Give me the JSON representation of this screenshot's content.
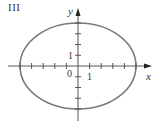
{
  "panel_label": "III",
  "chart_data": {
    "type": "line",
    "title": "III",
    "xlabel": "x",
    "ylabel": "y",
    "curve": "ellipse",
    "equation": "x^2/25 + y^2/16 = 1",
    "center": [
      0,
      0
    ],
    "semi_axis_x": 5,
    "semi_axis_y": 4,
    "xlim": [
      -6,
      6
    ],
    "ylim": [
      -5,
      5
    ],
    "tick_labels": {
      "x": [
        "1"
      ],
      "y": [
        "1"
      ],
      "origin": "0"
    },
    "x_ticks": [
      -5,
      -4,
      -3,
      -2,
      -1,
      1,
      2,
      3,
      4,
      5
    ],
    "y_ticks": [
      -4,
      -3,
      -2,
      -1,
      1,
      2,
      3,
      4
    ],
    "grid": false,
    "colors": {
      "curve": "#7a7a7a",
      "axes": "#555555"
    }
  },
  "labels": {
    "x_axis": "x",
    "y_axis": "y",
    "origin": "0",
    "x_unit": "1",
    "y_unit": "1"
  }
}
